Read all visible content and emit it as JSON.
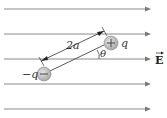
{
  "diagram": {
    "field_label": "E",
    "field_lines": 5,
    "separation_label": "2a",
    "angle_label": "θ",
    "positive_charge": {
      "label": "q",
      "sign": "+"
    },
    "negative_charge": {
      "label": "−q",
      "sign": "−"
    },
    "colors": {
      "field_line": "#8a8a8a",
      "charge_fill": "#c8c8c8",
      "text": "#333333"
    }
  }
}
